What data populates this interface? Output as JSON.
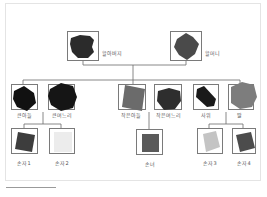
{
  "diagram": {
    "type": "family-tree",
    "colors": {
      "line": "#6a6a6a",
      "frame_border": "#e4e4e4",
      "box_border": "#7a7a7a",
      "label": "#555555"
    },
    "generations": [
      {
        "level": 1,
        "members": [
          {
            "id": "grandfather",
            "label": "할아버지",
            "photo_color": "#2b2b2b"
          },
          {
            "id": "grandmother",
            "label": "할머니",
            "photo_color": "#4a4a4a"
          }
        ]
      },
      {
        "level": 2,
        "members": [
          {
            "id": "eldest-son",
            "label": "큰아들",
            "photo_color": "#111111"
          },
          {
            "id": "eldest-daughter-in-law",
            "label": "큰며느리",
            "photo_color": "#151515"
          },
          {
            "id": "younger-son",
            "label": "작은아들",
            "photo_color": "#6b6b6b"
          },
          {
            "id": "younger-daughter-in-law",
            "label": "작은며느리",
            "photo_color": "#2e2e2e"
          },
          {
            "id": "son-in-law",
            "label": "사위",
            "photo_color": "#1a1a1a"
          },
          {
            "id": "daughter",
            "label": "딸",
            "photo_color": "#7d7d7d"
          }
        ]
      },
      {
        "level": 3,
        "members": [
          {
            "id": "grandchild-1",
            "label": "손자1",
            "photo_color": "#3d3d3d"
          },
          {
            "id": "grandchild-2",
            "label": "손자2",
            "photo_color": "#ececec"
          },
          {
            "id": "granddaughter",
            "label": "손녀",
            "photo_color": "#5a5a5a"
          },
          {
            "id": "grandchild-3",
            "label": "손자3",
            "photo_color": "#c4c4c4"
          },
          {
            "id": "grandchild-4",
            "label": "손자4",
            "photo_color": "#4c4c4c"
          }
        ]
      }
    ]
  }
}
